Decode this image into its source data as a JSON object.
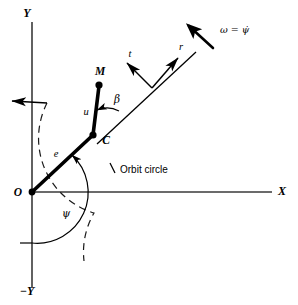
{
  "figure": {
    "type": "kinematics-diagram"
  },
  "axes": {
    "y_positive_label": "Y",
    "y_negative_label": "−Y",
    "x_positive_label": "X",
    "origin_label": "O"
  },
  "points": {
    "origin": "O",
    "center": "C",
    "mass": "M"
  },
  "vectors": {
    "radial_arm_label": "e",
    "offset_arm_label": "u",
    "tangential_label": "t",
    "radial_unit_label": "r"
  },
  "angles": {
    "psi_label": "ψ",
    "beta_label": "β"
  },
  "annotations": {
    "orbit_circle_label": "Orbit circle",
    "angular_velocity_label": "ω = ψ̇"
  }
}
